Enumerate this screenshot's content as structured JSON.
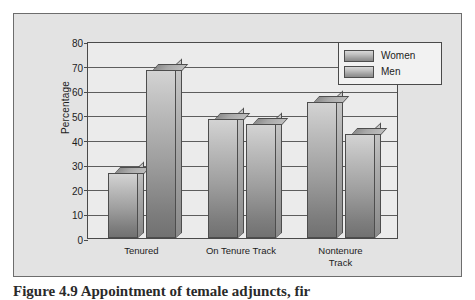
{
  "figure": {
    "caption": "Figure 4.9   Appointment of temale adjuncts, fir",
    "background_color": "#e3e3e3",
    "frame_color": "#6d6d6d"
  },
  "chart_data": {
    "type": "bar",
    "title": "",
    "xlabel": "",
    "ylabel": "Percentage",
    "ylim": [
      0,
      80
    ],
    "ytick_step": 10,
    "yticks": [
      0,
      10,
      20,
      30,
      40,
      50,
      60,
      70,
      80
    ],
    "grid": true,
    "legend_position": "top-right",
    "categories": [
      "Tenured",
      "On Tenure Track",
      "Nontenure\nTrack"
    ],
    "series": [
      {
        "name": "Women",
        "values": [
          26,
          48,
          55
        ],
        "color": "#a8a8a8"
      },
      {
        "name": "Men",
        "values": [
          68,
          46,
          42
        ],
        "color": "#a8a8a8"
      }
    ]
  },
  "legend": {
    "items": [
      {
        "label": "Women"
      },
      {
        "label": "Men"
      }
    ]
  }
}
